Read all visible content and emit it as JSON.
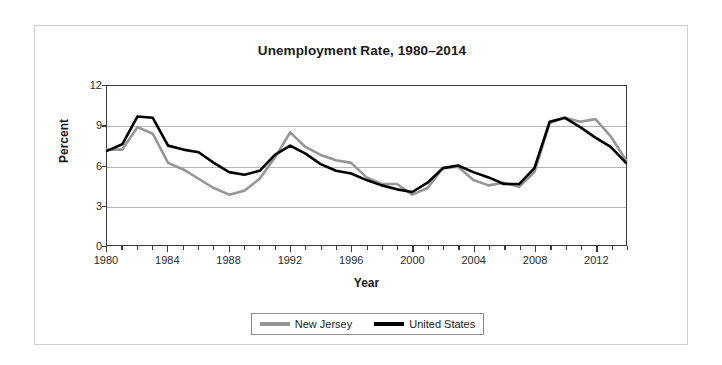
{
  "chart_data": {
    "type": "line",
    "title": "Unemployment Rate, 1980–2014",
    "xlabel": "Year",
    "ylabel": "Percent",
    "xlim": [
      1980,
      2014
    ],
    "ylim": [
      0,
      12
    ],
    "yticks": [
      0,
      3,
      6,
      9,
      12
    ],
    "xticks": [
      1980,
      1984,
      1988,
      1992,
      1996,
      2000,
      2004,
      2008,
      2012
    ],
    "x_minor_tick_interval": 1,
    "grid": "horizontal",
    "legend_position": "bottom-center",
    "x": [
      1980,
      1981,
      1982,
      1983,
      1984,
      1985,
      1986,
      1987,
      1988,
      1989,
      1990,
      1991,
      1992,
      1993,
      1994,
      1995,
      1996,
      1997,
      1998,
      1999,
      2000,
      2001,
      2002,
      2003,
      2004,
      2005,
      2006,
      2007,
      2008,
      2009,
      2010,
      2011,
      2012,
      2013,
      2014
    ],
    "series": [
      {
        "name": "New Jersey",
        "color": "#969696",
        "values": [
          7.2,
          7.2,
          8.9,
          8.4,
          6.2,
          5.7,
          5.0,
          4.3,
          3.8,
          4.1,
          5.0,
          6.6,
          8.5,
          7.4,
          6.8,
          6.4,
          6.2,
          5.1,
          4.6,
          4.6,
          3.8,
          4.3,
          5.8,
          5.9,
          4.9,
          4.5,
          4.7,
          4.4,
          5.5,
          9.2,
          9.6,
          9.3,
          9.5,
          8.2,
          6.4
        ]
      },
      {
        "name": "United States",
        "color": "#000000",
        "values": [
          7.1,
          7.6,
          9.7,
          9.6,
          7.5,
          7.2,
          7.0,
          6.2,
          5.5,
          5.3,
          5.6,
          6.8,
          7.5,
          6.9,
          6.1,
          5.6,
          5.4,
          4.9,
          4.5,
          4.2,
          4.0,
          4.7,
          5.8,
          6.0,
          5.5,
          5.1,
          4.6,
          4.6,
          5.8,
          9.3,
          9.6,
          8.9,
          8.1,
          7.4,
          6.2
        ]
      }
    ]
  },
  "legend": {
    "entries": [
      {
        "label": "New Jersey"
      },
      {
        "label": "United States"
      }
    ]
  }
}
